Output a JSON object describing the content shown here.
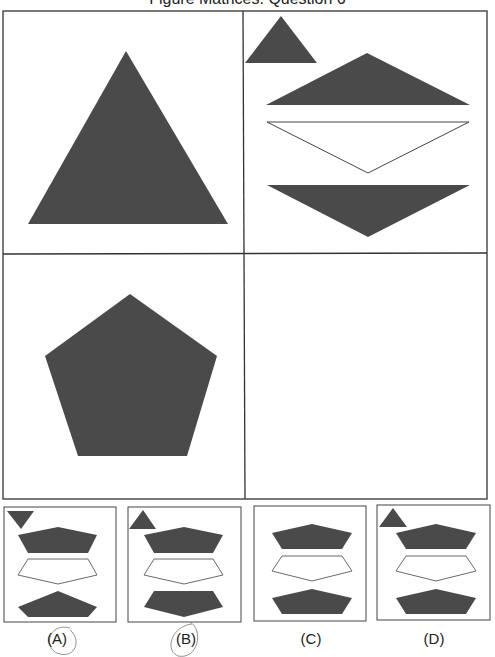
{
  "title": "Figure Matrices: Question 6",
  "colors": {
    "fill": "#4a4a4a",
    "stroke": "#333333",
    "background": "#ffffff",
    "annotation": "#555555"
  },
  "matrix": {
    "cells": [
      {
        "position": "top-left",
        "content": "large dark triangle"
      },
      {
        "position": "top-right",
        "content": "small dark triangle top-left, dark triangle pointing up, white inverted triangle, dark inverted triangle"
      },
      {
        "position": "bottom-left",
        "content": "large dark pentagon"
      },
      {
        "position": "bottom-right",
        "content": "empty (answer)"
      }
    ]
  },
  "options": [
    {
      "label": "(A)",
      "marker": "small inverted dark triangle"
    },
    {
      "label": "(B)",
      "marker": "small dark triangle"
    },
    {
      "label": "(C)",
      "marker": "none"
    },
    {
      "label": "(D)",
      "marker": "small dark triangle"
    }
  ]
}
